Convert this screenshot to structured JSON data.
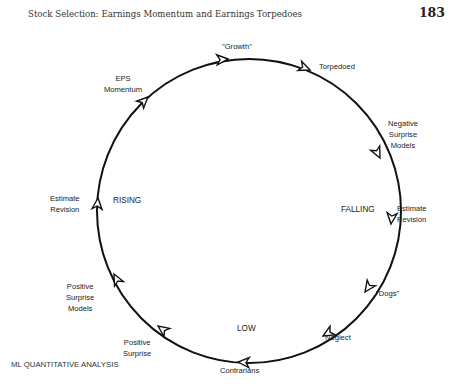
{
  "page": {
    "header": "Stock Selection: Earnings Momentum and Earnings Torpedoes",
    "page_number": "183",
    "footer": "ML QUANTITATIVE ANALYSIS"
  },
  "diagram": {
    "type": "cycle",
    "direction": "clockwise",
    "stages": [
      {
        "id": "growth",
        "label": "\"Growth\""
      },
      {
        "id": "torpedoed",
        "label": "Torpedoed"
      },
      {
        "id": "negative-surprise-models",
        "label_lines": [
          "Negative",
          "Surprise",
          "Models"
        ]
      },
      {
        "id": "estimate-revision-falling",
        "label_lines": [
          "Estimate",
          "Revision"
        ]
      },
      {
        "id": "dogs",
        "label": "\"Dogs\""
      },
      {
        "id": "neglect",
        "label": "Neglect"
      },
      {
        "id": "contrarians",
        "label": "Contrarians"
      },
      {
        "id": "positive-surprise",
        "label_lines": [
          "Positive",
          "Surprise"
        ]
      },
      {
        "id": "positive-surprise-models",
        "label_lines": [
          "Positive",
          "Surprise",
          "Models"
        ]
      },
      {
        "id": "estimate-revision-rising",
        "label_lines": [
          "Estimate",
          "Revision"
        ]
      },
      {
        "id": "eps-momentum",
        "label_lines": [
          "EPS",
          "Momentum"
        ]
      }
    ],
    "phases": {
      "rising": "RISING",
      "falling": "FALLING",
      "low": "LOW"
    }
  }
}
